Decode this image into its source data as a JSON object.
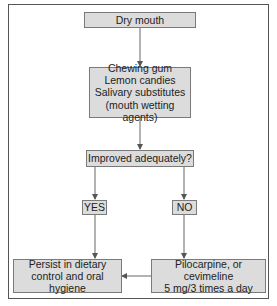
{
  "diagram": {
    "type": "flowchart",
    "nodes": {
      "start": {
        "label": "Dry mouth"
      },
      "first_line": {
        "lines": [
          "Chewing gum",
          "Lemon candies",
          "Salivary substitutes",
          "(mouth wetting agents)"
        ]
      },
      "decision": {
        "label": "Improved adequately?"
      },
      "yes": {
        "label": "YES"
      },
      "no": {
        "label": "NO"
      },
      "persist": {
        "lines": [
          "Persist in dietary",
          "control and oral hygiene"
        ]
      },
      "medication": {
        "lines": [
          "Pilocarpine, or cevimeline",
          "5 mg/3 times a day"
        ]
      }
    },
    "edges": [
      {
        "from": "Dry mouth",
        "to": "Chewing gum / Lemon candies / Salivary substitutes"
      },
      {
        "from": "Chewing gum / Lemon candies / Salivary substitutes",
        "to": "Improved adequately?"
      },
      {
        "from": "Improved adequately?",
        "to": "YES"
      },
      {
        "from": "Improved adequately?",
        "to": "NO"
      },
      {
        "from": "YES",
        "to": "Persist in dietary control and oral hygiene"
      },
      {
        "from": "NO",
        "to": "Pilocarpine, or cevimeline 5 mg/3 times a day"
      },
      {
        "from": "Pilocarpine, or cevimeline 5 mg/3 times a day",
        "to": "Persist in dietary control and oral hygiene"
      }
    ],
    "colors": {
      "box_fill": "#dcdcdc",
      "box_border": "#7a7a7a",
      "arrow": "#555555",
      "frame": "#555555"
    }
  }
}
